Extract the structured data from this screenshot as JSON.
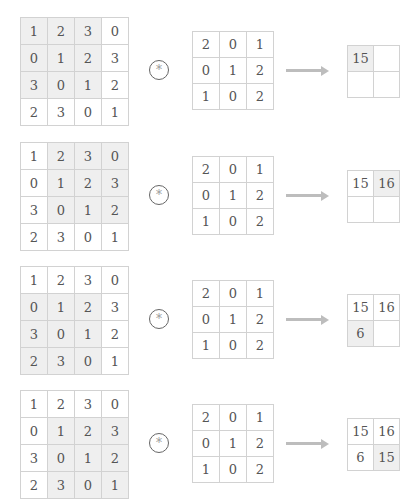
{
  "input_matrix": [
    [
      "1",
      "2",
      "3",
      "0"
    ],
    [
      "0",
      "1",
      "2",
      "3"
    ],
    [
      "3",
      "0",
      "1",
      "2"
    ],
    [
      "2",
      "3",
      "0",
      "1"
    ]
  ],
  "kernel": [
    [
      "2",
      "0",
      "1"
    ],
    [
      "0",
      "1",
      "2"
    ],
    [
      "1",
      "0",
      "2"
    ]
  ],
  "operator_symbol": "*",
  "highlight_color": "#efefef",
  "steps": [
    {
      "window_row": 0,
      "window_col": 0,
      "output": [
        [
          "15",
          ""
        ],
        [
          "",
          ""
        ]
      ],
      "output_highlight": [
        0,
        0
      ]
    },
    {
      "window_row": 0,
      "window_col": 1,
      "output": [
        [
          "15",
          "16"
        ],
        [
          "",
          ""
        ]
      ],
      "output_highlight": [
        0,
        1
      ]
    },
    {
      "window_row": 1,
      "window_col": 0,
      "output": [
        [
          "15",
          "16"
        ],
        [
          "6",
          ""
        ]
      ],
      "output_highlight": [
        1,
        0
      ]
    },
    {
      "window_row": 1,
      "window_col": 1,
      "output": [
        [
          "15",
          "16"
        ],
        [
          "6",
          "15"
        ]
      ],
      "output_highlight": [
        1,
        1
      ]
    }
  ]
}
